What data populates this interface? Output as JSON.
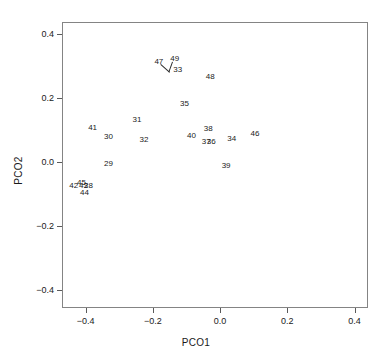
{
  "chart_data": {
    "type": "scatter",
    "title": "",
    "xlabel": "PCO1",
    "ylabel": "PCO2",
    "xlim": [
      -0.47,
      0.44
    ],
    "ylim": [
      -0.455,
      0.437
    ],
    "xticks": [
      "-0.4",
      "-0.2",
      "0.0",
      "0.2",
      "0.4"
    ],
    "xtickvalues": [
      -0.4,
      -0.2,
      0.0,
      0.2,
      0.4
    ],
    "yticks": [
      "0.4",
      "0.2",
      "0.0",
      "-0.2",
      "-0.4"
    ],
    "ytickvalues": [
      0.4,
      0.2,
      0.0,
      -0.2,
      -0.4
    ],
    "grid": false,
    "legend": null,
    "marker": "text-label",
    "points": [
      {
        "label": "47",
        "x": -0.182,
        "y": 0.313
      },
      {
        "label": "49",
        "x": -0.135,
        "y": 0.322
      },
      {
        "label": "33",
        "x": -0.126,
        "y": 0.287
      },
      {
        "label": "48",
        "x": -0.029,
        "y": 0.265
      },
      {
        "label": "35",
        "x": -0.106,
        "y": 0.18
      },
      {
        "label": "31",
        "x": -0.247,
        "y": 0.131
      },
      {
        "label": "41",
        "x": -0.379,
        "y": 0.107
      },
      {
        "label": "30",
        "x": -0.332,
        "y": 0.077
      },
      {
        "label": "32",
        "x": -0.226,
        "y": 0.068
      },
      {
        "label": "40",
        "x": -0.085,
        "y": 0.083
      },
      {
        "label": "38",
        "x": -0.035,
        "y": 0.102
      },
      {
        "label": "37",
        "x": -0.041,
        "y": 0.064
      },
      {
        "label": "36",
        "x": -0.026,
        "y": 0.062
      },
      {
        "label": "34",
        "x": 0.035,
        "y": 0.071
      },
      {
        "label": "46",
        "x": 0.104,
        "y": 0.089
      },
      {
        "label": "29",
        "x": -0.332,
        "y": -0.006
      },
      {
        "label": "39",
        "x": 0.018,
        "y": -0.012
      },
      {
        "label": "42",
        "x": -0.435,
        "y": -0.073
      },
      {
        "label": "45",
        "x": -0.412,
        "y": -0.064
      },
      {
        "label": "43",
        "x": -0.406,
        "y": -0.076
      },
      {
        "label": "28",
        "x": -0.391,
        "y": -0.075
      },
      {
        "label": "44",
        "x": -0.403,
        "y": -0.097
      }
    ],
    "leader_lines": [
      {
        "from_label": "47",
        "x1": -0.176,
        "y1": 0.305,
        "x2": -0.15,
        "y2": 0.281
      },
      {
        "from_label": "49",
        "x1": -0.139,
        "y1": 0.313,
        "x2": -0.15,
        "y2": 0.281
      }
    ]
  },
  "colors": {
    "frame": "#848484",
    "text": "#1a1a1a",
    "tick": "#5a5a5a",
    "background": "#ffffff"
  }
}
